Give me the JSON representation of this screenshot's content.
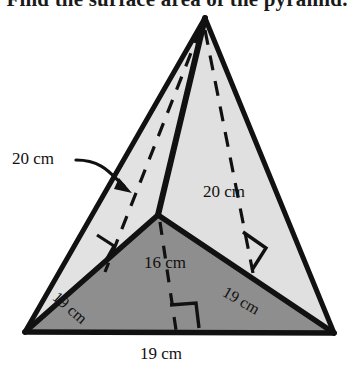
{
  "title": "Find the surface area of the pyramid.",
  "figure": {
    "name": "triangular-pyramid",
    "base_fill": "#8a8a8a",
    "left_face_fill": "#e8e8e8",
    "right_face_fill": "#dcdcdc",
    "stroke": "#111111",
    "dash_stroke": "#111111"
  },
  "labels": {
    "slant_left": "20 cm",
    "slant_right": "20 cm",
    "base_altitude": "16 cm",
    "edge_left": "19 cm",
    "edge_right": "19 cm",
    "base_front": "19 cm"
  }
}
